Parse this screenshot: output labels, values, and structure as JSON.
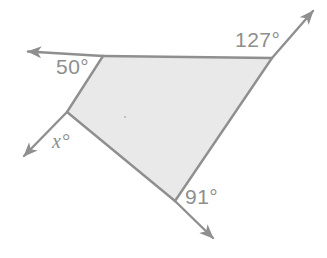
{
  "figure": {
    "kind": "geometry-diagram",
    "background_color": "#ffffff",
    "fill_color": "#e9e9e9",
    "stroke_color": "#8f8f8f",
    "label_color": "#8e8e8e",
    "shape": {
      "name": "quadrilateral",
      "vertices": [
        {
          "name": "top-left-vertex",
          "x": 103,
          "y": 56
        },
        {
          "name": "top-right-vertex",
          "x": 272,
          "y": 58
        },
        {
          "name": "bottom-vertex",
          "x": 175,
          "y": 201
        },
        {
          "name": "left-vertex",
          "x": 67,
          "y": 112
        }
      ]
    },
    "rays": [
      {
        "name": "ray-left-horizontal",
        "from_x": 103,
        "from_y": 56,
        "to_x": 24,
        "to_y": 51
      },
      {
        "name": "ray-upper-right",
        "from_x": 272,
        "from_y": 58,
        "to_x": 317,
        "to_y": 7
      },
      {
        "name": "ray-lower-left",
        "from_x": 67,
        "from_y": 112,
        "to_x": 20,
        "to_y": 160
      },
      {
        "name": "ray-lower-right",
        "from_x": 175,
        "from_y": 201,
        "to_x": 217,
        "to_y": 242
      }
    ],
    "labels": {
      "angle_top_left": "50°",
      "angle_top_right": "127°",
      "angle_left_unknown": "x°",
      "angle_bottom": "91°"
    },
    "center_dot": {
      "x": 125,
      "y": 117
    }
  }
}
